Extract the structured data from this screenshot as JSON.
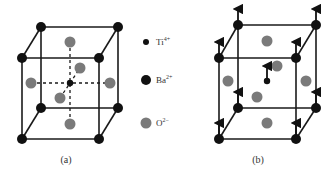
{
  "figure": {
    "panel_a": {
      "caption": "(a)",
      "description": "Cubic perovskite BaTiO3 unit cell, Ti at center"
    },
    "panel_b": {
      "caption": "(b)",
      "description": "Tetragonal distorted cell with displacement arrows"
    },
    "legend": {
      "items": [
        {
          "ion": "Ti",
          "charge": "4+",
          "marker": "small-black-dot"
        },
        {
          "ion": "Ba",
          "charge": "2+",
          "marker": "large-black-dot"
        },
        {
          "ion": "O",
          "charge": "2−",
          "marker": "gray-dot"
        }
      ]
    },
    "colors": {
      "line": "#1a1a1a",
      "ba": "#111111",
      "ti": "#111111",
      "o": "#7a7a7a"
    }
  }
}
